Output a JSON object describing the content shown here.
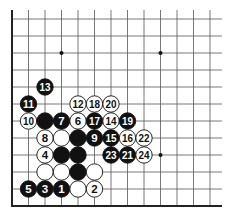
{
  "diagram": {
    "type": "go-board-corner",
    "grid": {
      "origin_x": 12,
      "origin_y": 19,
      "col_spacing": 16.5,
      "row_spacing": 17,
      "cols": 13,
      "rows": 12,
      "top_y": 10,
      "right_x": 222,
      "bottom_edge_y": 206,
      "left_edge_x": 12
    },
    "colors": {
      "background": "#ffffff",
      "line": "#555555",
      "edge": "#222222",
      "black_stone": "#111111",
      "white_stone": "#ffffff",
      "white_text": "#ffffff",
      "black_text": "#111111"
    },
    "star_points": [
      {
        "col": 3,
        "row": 2
      },
      {
        "col": 9,
        "row": 2
      },
      {
        "col": 9,
        "row": 8
      }
    ],
    "stones": [
      {
        "color": "black",
        "col": 2,
        "row": 4,
        "label": "13"
      },
      {
        "color": "white",
        "col": 4,
        "row": 5,
        "label": "12"
      },
      {
        "color": "white",
        "col": 5,
        "row": 5,
        "label": "18"
      },
      {
        "color": "white",
        "col": 6,
        "row": 5,
        "label": "20"
      },
      {
        "color": "black",
        "col": 1,
        "row": 5,
        "label": "11"
      },
      {
        "color": "white",
        "col": 1,
        "row": 6,
        "label": "10"
      },
      {
        "color": "black",
        "col": 2,
        "row": 6,
        "label": ""
      },
      {
        "color": "black",
        "col": 3,
        "row": 6,
        "label": "7"
      },
      {
        "color": "white",
        "col": 4,
        "row": 6,
        "label": "6"
      },
      {
        "color": "black",
        "col": 5,
        "row": 6,
        "label": "17"
      },
      {
        "color": "white",
        "col": 6,
        "row": 6,
        "label": "14"
      },
      {
        "color": "black",
        "col": 7,
        "row": 6,
        "label": "19"
      },
      {
        "color": "white",
        "col": 2,
        "row": 7,
        "label": "8"
      },
      {
        "color": "white",
        "col": 3,
        "row": 7,
        "label": ""
      },
      {
        "color": "black",
        "col": 4,
        "row": 7,
        "label": ""
      },
      {
        "color": "black",
        "col": 5,
        "row": 7,
        "label": "9"
      },
      {
        "color": "black",
        "col": 6,
        "row": 7,
        "label": "15"
      },
      {
        "color": "white",
        "col": 7,
        "row": 7,
        "label": "16"
      },
      {
        "color": "white",
        "col": 8,
        "row": 7,
        "label": "22"
      },
      {
        "color": "white",
        "col": 2,
        "row": 8,
        "label": "4"
      },
      {
        "color": "black",
        "col": 3,
        "row": 8,
        "label": ""
      },
      {
        "color": "black",
        "col": 4,
        "row": 8,
        "label": ""
      },
      {
        "color": "black",
        "col": 6,
        "row": 8,
        "label": "23"
      },
      {
        "color": "black",
        "col": 7,
        "row": 8,
        "label": "21"
      },
      {
        "color": "white",
        "col": 8,
        "row": 8,
        "label": "24"
      },
      {
        "color": "white",
        "col": 2,
        "row": 9,
        "label": ""
      },
      {
        "color": "white",
        "col": 3,
        "row": 9,
        "label": ""
      },
      {
        "color": "black",
        "col": 4,
        "row": 9,
        "label": ""
      },
      {
        "color": "white",
        "col": 5,
        "row": 9,
        "label": ""
      },
      {
        "color": "black",
        "col": 1,
        "row": 10,
        "label": "5"
      },
      {
        "color": "black",
        "col": 2,
        "row": 10,
        "label": "3"
      },
      {
        "color": "black",
        "col": 3,
        "row": 10,
        "label": "1"
      },
      {
        "color": "white",
        "col": 4,
        "row": 10,
        "label": ""
      },
      {
        "color": "white",
        "col": 5,
        "row": 10,
        "label": "2"
      }
    ]
  }
}
